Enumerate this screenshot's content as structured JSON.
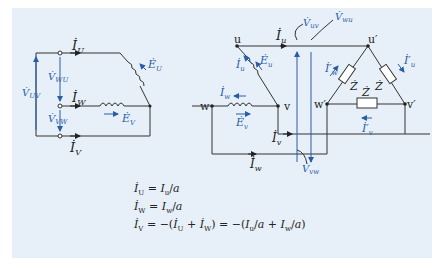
{
  "colors": {
    "panel_bg": "#e7f0f8",
    "wire": "#333333",
    "accent_blue": "#2a5da8"
  },
  "left_circuit": {
    "currents": {
      "iU": "İ",
      "iU_sub": "U",
      "iW": "İ",
      "iW_sub": "W",
      "iV": "İ",
      "iV_sub": "V"
    },
    "emfs": {
      "EU": "Ė",
      "EU_sub": "U",
      "EV": "Ė",
      "EV_sub": "V"
    },
    "voltages": {
      "VWU": "V̇",
      "VWU_sub": "WU",
      "VVW": "V̇",
      "VVW_sub": "VW",
      "VUV": "V̇",
      "VUV_sub": "UV"
    }
  },
  "right_circuit": {
    "nodes": {
      "u": "u",
      "v": "v",
      "w": "w",
      "u_p": "u′",
      "v_p": "v′",
      "w_p": "w′"
    },
    "currents": {
      "iu": "İ",
      "iu_sub": "u",
      "iv": "İ",
      "iv_sub": "v",
      "iw": "İ",
      "iw_sub": "w",
      "iu_phase": "İ",
      "iu_phase_sub": "u",
      "iw_phase": "İ",
      "iw_phase_sub": "w",
      "iu_load": "İ′",
      "iu_load_sub": "u",
      "iw_load": "İ′",
      "iw_load_sub": "w",
      "iv_load": "İ′",
      "iv_load_sub": "v"
    },
    "emfs": {
      "Eu": "Ė",
      "Eu_sub": "u",
      "Ev": "Ė",
      "Ev_sub": "v"
    },
    "voltages": {
      "Vuv": "V̇",
      "Vuv_sub": "uv",
      "Vwu": "V̇",
      "Vwu_sub": "wu",
      "Vvw": "V̇",
      "Vvw_sub": "vw"
    },
    "impedance": "Ż"
  },
  "equations": [
    {
      "lhs": "İ",
      "lhs_sub": "U",
      "rhs": "= I",
      "rhs_sub": "u",
      "den": "a"
    },
    {
      "lhs": "İ",
      "lhs_sub": "W",
      "rhs": "= I",
      "rhs_sub": "w",
      "den": "a"
    },
    {
      "text": "İ_V = −(İ_U + İ_W) = −(I_u/a + I_w/a)"
    }
  ]
}
